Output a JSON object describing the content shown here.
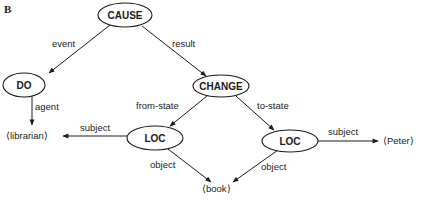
{
  "figure": {
    "panel_label": "B",
    "nodes": {
      "cause": "CAUSE",
      "do": "DO",
      "change": "CHANGE",
      "loc_from": "LOC",
      "loc_to": "LOC"
    },
    "leaves": {
      "librarian": "⟨librarian⟩",
      "peter": "⟨Peter⟩",
      "book": "⟨book⟩"
    },
    "edges": {
      "cause_do": "event",
      "cause_change": "result",
      "do_librarian": "agent",
      "change_loc_from": "from-state",
      "change_loc_to": "to-state",
      "loc_from_librarian": "subject",
      "loc_from_book": "object",
      "loc_to_peter": "subject",
      "loc_to_book": "object"
    },
    "colors": {
      "stroke": "#1a1a1a",
      "background": "#ffffff"
    }
  }
}
